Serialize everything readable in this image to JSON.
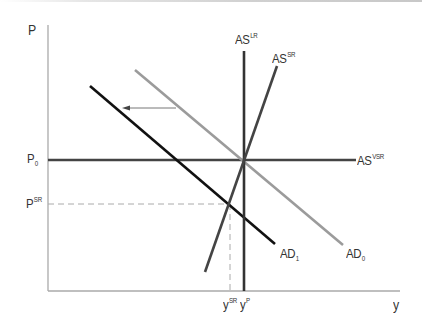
{
  "diagram": {
    "type": "AS-AD macroeconomic diagram",
    "axes": {
      "y_axis_label": "P",
      "x_axis_label": "y"
    },
    "price_labels": {
      "p0": {
        "base": "P",
        "sub": "0"
      },
      "psr": {
        "base": "P",
        "sup": "SR"
      }
    },
    "output_labels": {
      "ysr": {
        "base": "y",
        "sup": "SR"
      },
      "yp": {
        "base": "y",
        "sup": "P"
      }
    },
    "curves": {
      "as_lr": {
        "base": "AS",
        "sup": "LR",
        "color": "#333333"
      },
      "as_sr": {
        "base": "AS",
        "sup": "SR",
        "color": "#444444"
      },
      "as_vsr": {
        "base": "AS",
        "sup": "VSR",
        "color": "#444444"
      },
      "ad0": {
        "base": "AD",
        "sub": "0",
        "color": "#9b9b9b"
      },
      "ad1": {
        "base": "AD",
        "sub": "1",
        "color": "#111111"
      }
    },
    "annotations": {
      "shift_arrow": "AD0 shifts left to AD1"
    },
    "colors": {
      "axis": "#aaaaaa",
      "guide_dash": "#aaaaaa",
      "text": "#333333"
    }
  }
}
